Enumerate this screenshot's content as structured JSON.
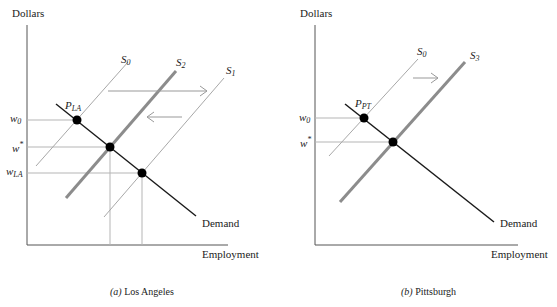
{
  "panels": [
    {
      "id": "a",
      "caption_letter": "(a)",
      "caption_text": " Los Angeles",
      "y_axis_label": "Dollars",
      "x_axis_label": "Employment",
      "demand_label": "Demand",
      "point_label_main": "P",
      "point_label_sub": "LA",
      "wage_labels": [
        {
          "main": "w",
          "sub": "0"
        },
        {
          "main": "w",
          "sup": "*"
        },
        {
          "main": "w",
          "sub": "LA"
        }
      ],
      "supply_labels": [
        {
          "main": "S",
          "sub": "0"
        },
        {
          "main": "S",
          "sub": "2"
        },
        {
          "main": "S",
          "sub": "1"
        }
      ],
      "arrows": [
        "right",
        "left"
      ]
    },
    {
      "id": "b",
      "caption_letter": "(b)",
      "caption_text": " Pittsburgh",
      "y_axis_label": "Dollars",
      "x_axis_label": "Employment",
      "demand_label": "Demand",
      "point_label_main": "P",
      "point_label_sub": "PT",
      "wage_labels": [
        {
          "main": "w",
          "sub": "0"
        },
        {
          "main": "w",
          "sup": "*"
        }
      ],
      "supply_labels": [
        {
          "main": "S",
          "sub": "0"
        },
        {
          "main": "S",
          "sub": "3"
        }
      ],
      "arrows": [
        "right"
      ]
    }
  ],
  "colors": {
    "axis": "#555555",
    "demand": "#1a1a1a",
    "supply_thin": "#a8a8a8",
    "supply_thick": "#8c8c8c",
    "guide": "#b5b5b5",
    "arrow": "#999999",
    "point": "#000000"
  }
}
